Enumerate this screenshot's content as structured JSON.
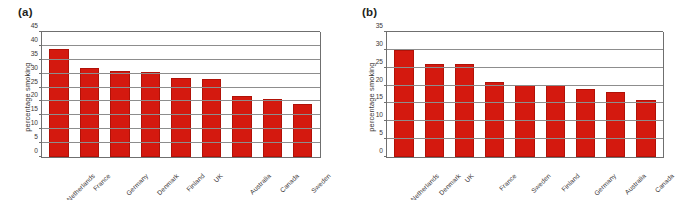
{
  "figure": {
    "panels": [
      {
        "id": "a",
        "label": "(a)",
        "chart_data": {
          "type": "bar",
          "title": "",
          "xlabel": "",
          "ylabel": "percentage smoking",
          "ylim": [
            0,
            45
          ],
          "ytick_step": 5,
          "yticks": [
            0,
            5,
            10,
            15,
            20,
            25,
            30,
            35,
            40,
            45
          ],
          "grid": true,
          "legend": "none",
          "categories": [
            "Netherlands",
            "France",
            "Germany",
            "Denmark",
            "Finland",
            "UK",
            "Australia",
            "Canada",
            "Sweden"
          ],
          "values": [
            39,
            32,
            31,
            30.5,
            28.5,
            28.2,
            22,
            20.8,
            19
          ],
          "bar_color": "#d4190f"
        }
      },
      {
        "id": "b",
        "label": "(b)",
        "chart_data": {
          "type": "bar",
          "title": "",
          "xlabel": "",
          "ylabel": "percentage smoking",
          "ylim": [
            0,
            35
          ],
          "ytick_step": 5,
          "yticks": [
            0,
            5,
            10,
            15,
            20,
            25,
            30,
            35
          ],
          "grid": true,
          "legend": "none",
          "categories": [
            "Netherlands",
            "Denmark",
            "UK",
            "France",
            "Sweden",
            "Finland",
            "Germany",
            "Australia",
            "Canada"
          ],
          "values": [
            30,
            26.1,
            26,
            21.1,
            20.1,
            20.2,
            19,
            18.3,
            16
          ],
          "bar_color": "#d4190f"
        }
      }
    ]
  },
  "colors": {
    "bar": "#d4190f",
    "grid": "#8d8d8d",
    "axis": "#6f6f6f",
    "text": "#3a3637",
    "background": "#ffffff"
  }
}
